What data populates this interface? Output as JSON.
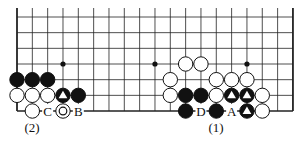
{
  "diagram": {
    "type": "go-board-fragment",
    "grid": {
      "columns": 19,
      "rows_visible": 7,
      "x0": 17,
      "dx": 15.33,
      "y0": 17,
      "dy": 15.67,
      "top_extension": 9,
      "edges": {
        "left": true,
        "right": true,
        "bottom": true,
        "top": false
      }
    },
    "star_points": [
      {
        "col": 3,
        "row": 3
      },
      {
        "col": 9,
        "row": 3
      },
      {
        "col": 15,
        "row": 3
      }
    ],
    "stones": [
      {
        "col": 0,
        "row": 4,
        "color": "black"
      },
      {
        "col": 1,
        "row": 4,
        "color": "black"
      },
      {
        "col": 2,
        "row": 4,
        "color": "black"
      },
      {
        "col": 0,
        "row": 5,
        "color": "white"
      },
      {
        "col": 1,
        "row": 5,
        "color": "white"
      },
      {
        "col": 2,
        "row": 5,
        "color": "white"
      },
      {
        "col": 3,
        "row": 5,
        "color": "black",
        "mark": "triangle"
      },
      {
        "col": 4,
        "row": 5,
        "color": "black"
      },
      {
        "col": 1,
        "row": 6,
        "color": "white"
      },
      {
        "col": 3,
        "row": 6,
        "color": "white",
        "mark": "circle"
      },
      {
        "col": 11,
        "row": 3,
        "color": "white"
      },
      {
        "col": 12,
        "row": 3,
        "color": "white"
      },
      {
        "col": 10,
        "row": 4,
        "color": "white"
      },
      {
        "col": 13,
        "row": 4,
        "color": "white"
      },
      {
        "col": 14,
        "row": 4,
        "color": "white"
      },
      {
        "col": 15,
        "row": 4,
        "color": "white"
      },
      {
        "col": 10,
        "row": 5,
        "color": "white"
      },
      {
        "col": 11,
        "row": 5,
        "color": "black"
      },
      {
        "col": 12,
        "row": 5,
        "color": "black"
      },
      {
        "col": 13,
        "row": 5,
        "color": "white"
      },
      {
        "col": 14,
        "row": 5,
        "color": "black",
        "mark": "triangle"
      },
      {
        "col": 15,
        "row": 5,
        "color": "black",
        "mark": "triangle"
      },
      {
        "col": 16,
        "row": 5,
        "color": "white"
      },
      {
        "col": 11,
        "row": 6,
        "color": "black"
      },
      {
        "col": 13,
        "row": 6,
        "color": "black"
      },
      {
        "col": 15,
        "row": 6,
        "color": "black",
        "mark": "triangle"
      },
      {
        "col": 16,
        "row": 6,
        "color": "white"
      }
    ],
    "point_labels": [
      {
        "col": 2,
        "row": 6,
        "text": "C"
      },
      {
        "col": 4,
        "row": 6,
        "text": "B"
      },
      {
        "col": 12,
        "row": 6,
        "text": "D"
      },
      {
        "col": 14,
        "row": 6,
        "text": "A"
      }
    ],
    "captions": [
      {
        "text": "(2)",
        "x": 32,
        "y": 132
      },
      {
        "text": "(1)",
        "x": 216,
        "y": 132
      }
    ]
  }
}
